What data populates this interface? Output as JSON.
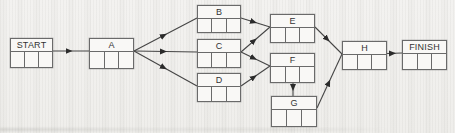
{
  "diagram": {
    "type": "activity-network",
    "nodes": [
      {
        "id": "start",
        "label": "START",
        "cells": [
          "",
          "",
          ""
        ]
      },
      {
        "id": "a",
        "label": "A",
        "cells": [
          "",
          "",
          ""
        ]
      },
      {
        "id": "b",
        "label": "B",
        "cells": [
          "",
          "",
          ""
        ]
      },
      {
        "id": "c",
        "label": "C",
        "cells": [
          "",
          "",
          ""
        ]
      },
      {
        "id": "d",
        "label": "D",
        "cells": [
          "",
          "",
          ""
        ]
      },
      {
        "id": "e",
        "label": "E",
        "cells": [
          "",
          "",
          ""
        ]
      },
      {
        "id": "f",
        "label": "F",
        "cells": [
          "",
          "",
          ""
        ]
      },
      {
        "id": "g",
        "label": "G",
        "cells": [
          "",
          "",
          ""
        ]
      },
      {
        "id": "h",
        "label": "H",
        "cells": [
          "",
          "",
          ""
        ]
      },
      {
        "id": "finish",
        "label": "FINISH",
        "cells": [
          "",
          "",
          ""
        ]
      }
    ],
    "edges": [
      {
        "from": "START",
        "to": "A"
      },
      {
        "from": "A",
        "to": "B"
      },
      {
        "from": "A",
        "to": "C"
      },
      {
        "from": "A",
        "to": "D"
      },
      {
        "from": "B",
        "to": "E"
      },
      {
        "from": "C",
        "to": "E"
      },
      {
        "from": "C",
        "to": "F"
      },
      {
        "from": "D",
        "to": "F"
      },
      {
        "from": "F",
        "to": "G"
      },
      {
        "from": "E",
        "to": "H"
      },
      {
        "from": "G",
        "to": "H"
      },
      {
        "from": "H",
        "to": "FINISH"
      }
    ],
    "colors": {
      "line": "#454545",
      "arrowhead": "#2b2b2b",
      "box_border": "#6a6a6a",
      "box_fill": "#f9f8f6",
      "text": "#333333",
      "background": "#f1f0ed"
    }
  }
}
